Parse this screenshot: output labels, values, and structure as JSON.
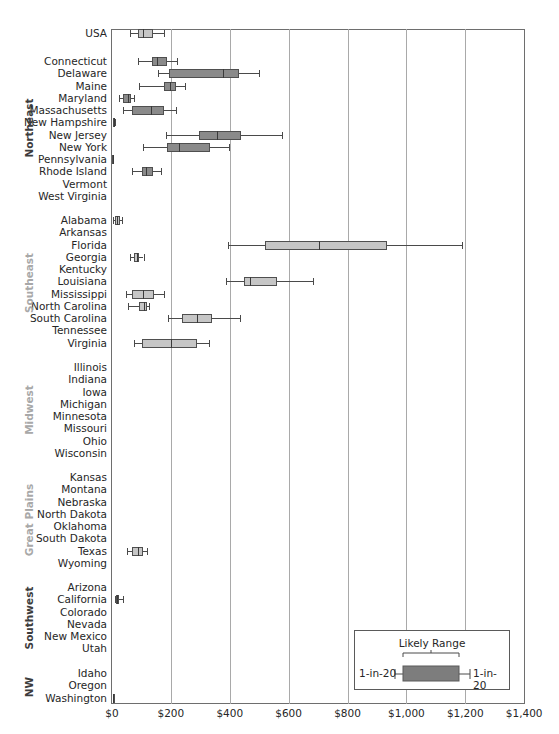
{
  "chart_data": {
    "type": "boxplot",
    "title": "",
    "xlabel": "",
    "ylabel": "",
    "x_axis": {
      "min": 0,
      "max": 1400,
      "ticks": [
        0,
        200,
        400,
        600,
        800,
        1000,
        1200,
        1400
      ],
      "tick_labels": [
        "$0",
        "$200",
        "$400",
        "$600",
        "$800",
        "$1,000",
        "$1,200",
        "$1,400"
      ],
      "gridlines": true
    },
    "colors": {
      "dark_box": "#8a8a8a",
      "light_box": "#c6c6c6",
      "dark_region_text": "#3c3c3c",
      "light_region_text": "#a8a8a8"
    },
    "legend": {
      "title": "Likely Range",
      "left_label": "1-in-20",
      "right_label": "1-in-20",
      "position": "bottom-right"
    },
    "groups": [
      {
        "region": "",
        "shade": "light",
        "rows": [
          {
            "label": "USA",
            "stats": [
              62,
              87,
              106,
              139,
              175
            ]
          }
        ]
      },
      {
        "region": "Northeast",
        "shade": "dark",
        "rows": [
          {
            "label": "Connecticut",
            "stats": [
              89,
              137,
              152,
              188,
              220
            ]
          },
          {
            "label": "Delaware",
            "stats": [
              157,
              195,
              376,
              433,
              500
            ]
          },
          {
            "label": "Maine",
            "stats": [
              92,
              177,
              198,
              218,
              247
            ]
          },
          {
            "label": "Maryland",
            "stats": [
              24,
              36,
              56,
              64,
              74
            ]
          },
          {
            "label": "Massachusetts",
            "stats": [
              38,
              69,
              132,
              177,
              219
            ]
          },
          {
            "label": "New Hampshire",
            "stats": [
              3,
              5,
              7,
              9,
              11
            ]
          },
          {
            "label": "New Jersey",
            "stats": [
              184,
              294,
              355,
              437,
              577
            ]
          },
          {
            "label": "New York",
            "stats": [
              104,
              186,
              227,
              334,
              399
            ]
          },
          {
            "label": "Pennsylvania",
            "stats": [
              1,
              1,
              2,
              3,
              3
            ]
          },
          {
            "label": "Rhode Island",
            "stats": [
              69,
              101,
              114,
              140,
              166
            ]
          },
          {
            "label": "Vermont",
            "stats": null
          },
          {
            "label": "West Virginia",
            "stats": null
          }
        ]
      },
      {
        "region": "Southeast",
        "shade": "light",
        "rows": [
          {
            "label": "Alabama",
            "stats": [
              4,
              10,
              18,
              26,
              35
            ]
          },
          {
            "label": "Arkansas",
            "stats": null
          },
          {
            "label": "Florida",
            "stats": [
              393,
              519,
              702,
              933,
              1190
            ]
          },
          {
            "label": "Georgia",
            "stats": [
              61,
              76,
              84,
              93,
              107
            ]
          },
          {
            "label": "Kentucky",
            "stats": null
          },
          {
            "label": "Louisiana",
            "stats": [
              388,
              447,
              469,
              559,
              684
            ]
          },
          {
            "label": "Mississippi",
            "stats": [
              47,
              68,
              105,
              141,
              177
            ]
          },
          {
            "label": "North Carolina",
            "stats": [
              55,
              93,
              107,
              118,
              127
            ]
          },
          {
            "label": "South Carolina",
            "stats": [
              190,
              237,
              290,
              341,
              434
            ]
          },
          {
            "label": "Tennessee",
            "stats": null
          },
          {
            "label": "Virginia",
            "stats": [
              76,
              102,
              200,
              288,
              330
            ]
          }
        ]
      },
      {
        "region": "Midwest",
        "shade": "light",
        "rows": [
          {
            "label": "Illinois",
            "stats": null
          },
          {
            "label": "Indiana",
            "stats": null
          },
          {
            "label": "Iowa",
            "stats": null
          },
          {
            "label": "Michigan",
            "stats": null
          },
          {
            "label": "Minnesota",
            "stats": null
          },
          {
            "label": "Missouri",
            "stats": null
          },
          {
            "label": "Ohio",
            "stats": null
          },
          {
            "label": "Wisconsin",
            "stats": null
          }
        ]
      },
      {
        "region": "Great Plains",
        "shade": "light",
        "rows": [
          {
            "label": "Kansas",
            "stats": null
          },
          {
            "label": "Montana",
            "stats": null
          },
          {
            "label": "Nebraska",
            "stats": null
          },
          {
            "label": "North Dakota",
            "stats": null
          },
          {
            "label": "Oklahoma",
            "stats": null
          },
          {
            "label": "South Dakota",
            "stats": null
          },
          {
            "label": "Texas",
            "stats": [
              50,
              68,
              88,
              105,
              120
            ]
          },
          {
            "label": "Wyoming",
            "stats": null
          }
        ]
      },
      {
        "region": "Southwest",
        "shade": "dark",
        "rows": [
          {
            "label": "Arizona",
            "stats": null
          },
          {
            "label": "California",
            "stats": [
              10,
              12,
              18,
              24,
              37
            ]
          },
          {
            "label": "Colorado",
            "stats": null
          },
          {
            "label": "Nevada",
            "stats": null
          },
          {
            "label": "New Mexico",
            "stats": null
          },
          {
            "label": "Utah",
            "stats": null
          }
        ]
      },
      {
        "region": "NW",
        "shade": "dark",
        "rows": [
          {
            "label": "Idaho",
            "stats": null
          },
          {
            "label": "Oregon",
            "stats": null
          },
          {
            "label": "Washington",
            "stats": [
              2,
              2,
              3,
              4,
              4
            ]
          }
        ]
      }
    ],
    "stats_order": [
      "low_whisker_1_in_20",
      "box_low",
      "median",
      "box_high",
      "high_whisker_1_in_20"
    ]
  }
}
